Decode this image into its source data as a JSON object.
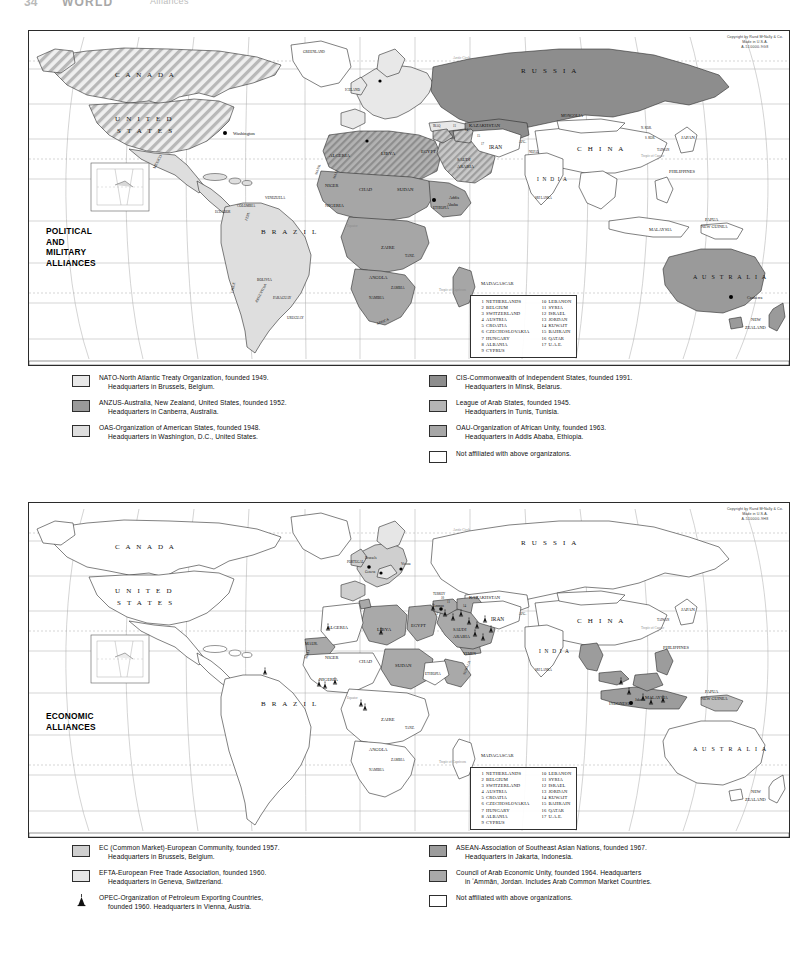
{
  "header": {
    "page_number": "34",
    "title": "WORLD",
    "subtitle": "Alliances"
  },
  "copyright": {
    "line1": "Copyright by Rand MᶜNally & Co.",
    "line2": "Made in U.S.A.",
    "line3_top": "A-510000-9G8",
    "line3_bottom": "A-510000-9H8",
    "suffix": "-2-3-3"
  },
  "maps": [
    {
      "id": "political-military",
      "caption": [
        "POLITICAL",
        "AND",
        "MILITARY",
        "ALLIANCES"
      ],
      "projection_note": "Robinson world projection, graticule at 20° intervals"
    },
    {
      "id": "economic",
      "caption": [
        "ECONOMIC",
        "ALLIANCES"
      ],
      "projection_note": "Robinson world projection, graticule at 20° intervals"
    }
  ],
  "index_box": {
    "left_column": [
      {
        "num": "1",
        "name": "NETHERLANDS"
      },
      {
        "num": "2",
        "name": "BELGIUM"
      },
      {
        "num": "3",
        "name": "SWITZERLAND"
      },
      {
        "num": "4",
        "name": "AUSTRIA"
      },
      {
        "num": "5",
        "name": "CROATIA"
      },
      {
        "num": "6",
        "name": "CZECHOSLOVAKIA"
      },
      {
        "num": "7",
        "name": "HUNGARY"
      },
      {
        "num": "8",
        "name": "ALBANIA"
      },
      {
        "num": "9",
        "name": "CYPRUS"
      }
    ],
    "right_column": [
      {
        "num": "10",
        "name": "LEBANON"
      },
      {
        "num": "11",
        "name": "SYRIA"
      },
      {
        "num": "12",
        "name": "ISRAEL"
      },
      {
        "num": "13",
        "name": "JORDAN"
      },
      {
        "num": "14",
        "name": "KUWAIT"
      },
      {
        "num": "15",
        "name": "BAHRAIN"
      },
      {
        "num": "16",
        "name": "QATAR"
      },
      {
        "num": "17",
        "name": "U.A.E."
      }
    ]
  },
  "legend_political": {
    "left": [
      {
        "key": "nato",
        "swatch": "#e8e8e8",
        "line1": "NATO-North Atlantic Treaty Organization, founded 1949.",
        "line2": "Headquarters in Brussels, Belgium."
      },
      {
        "key": "anzus",
        "swatch": "#9a9a9a",
        "line1": "ANZUS-Australia, New Zealand, United States, founded 1952.",
        "line2": "Headquarters in Canberra, Australia."
      },
      {
        "key": "oas",
        "swatch": "#dedede",
        "line1": "OAS-Organization of American States, founded 1948.",
        "line2": "Headquarters in Washington, D.C., United States."
      }
    ],
    "right": [
      {
        "key": "cis",
        "swatch": "#8d8d8d",
        "line1": "CIS-Commonwealth of Independent States, founded 1991.",
        "line2": "Headquarters in Minsk, Belarus."
      },
      {
        "key": "arab-league",
        "swatch": "#b5b5b5",
        "line1": "League of Arab States, founded 1945.",
        "line2": "Headquarters in Tunis, Tunisia."
      },
      {
        "key": "oau",
        "swatch": "#a6a6a6",
        "line1": "OAU-Organization of African Unity, founded 1963.",
        "line2": "Headquarters in Addis Ababa, Ethiopia."
      },
      {
        "key": "unaffiliated",
        "swatch": "#ffffff",
        "line1": "Not affiliated with above organizatons.",
        "line2": ""
      }
    ]
  },
  "legend_economic": {
    "left": [
      {
        "key": "ec",
        "swatch": "#cfcfcf",
        "line1": "EC (Common Market)-European Community, founded 1957.",
        "line2": "Headquarters in Brussels, Belgium."
      },
      {
        "key": "efta",
        "swatch": "#e6e6e6",
        "line1": "EFTA-European Free Trade Association, founded 1960.",
        "line2": "Headquarters in Geneva, Switzerland."
      },
      {
        "key": "opec",
        "swatch": "derrick",
        "line1": "OPEC-Organization of Petroleum Exporting Countries,",
        "line2": "founded 1960. Headquarters in Vienna, Austria."
      }
    ],
    "right": [
      {
        "key": "asean",
        "swatch": "#9c9c9c",
        "line1": "ASEAN-Association of Southeast Asian Nations, founded 1967.",
        "line2": "Headquarters in Jakarta, Indonesia."
      },
      {
        "key": "caeu",
        "swatch": "#a9a9a9",
        "line1": "Council of Arab Economic Unity, founded 1964. Headquarters",
        "line2": "in ʻAmmān, Jordan. Includes Arab Common Market Countries."
      },
      {
        "key": "unaffiliated",
        "swatch": "#ffffff",
        "line1": "Not affiliated with above organizations.",
        "line2": ""
      }
    ]
  },
  "map_labels": {
    "countries_major": [
      "CANADA",
      "UNITED STATES",
      "MEXICO",
      "BRAZIL",
      "RUSSIA",
      "CHINA",
      "INDIA",
      "AUSTRALIA",
      "NEW ZEALAND",
      "KAZAKHSTAN",
      "IRAN",
      "SAUDI ARABIA",
      "ALGERIA",
      "LIBYA",
      "EGYPT",
      "SUDAN",
      "CHAD",
      "NIGER",
      "NIGERIA",
      "ZAIRE",
      "ANGOLA",
      "MADAGASCAR",
      "JAPAN",
      "PHILIPPINES",
      "INDONESIA",
      "MALAYSIA",
      "PAPUA NEW GUINEA",
      "MONGOLIA",
      "ARGENTINA",
      "CHILE",
      "PERU",
      "BOLIVIA",
      "PARAGUAY",
      "URUGUAY",
      "COLOMBIA",
      "VENEZUELA",
      "ECUADOR",
      "GREENLAND",
      "MAUR.",
      "MALI",
      "ETHIOPIA",
      "SOMALIA",
      "SOUTH AFRICA",
      "TURKEY",
      "UKRAINE",
      "SPAIN",
      "FRANCE",
      "GERMANY",
      "POLAND",
      "ITALY",
      "TAIWAN",
      "THAI.",
      "VIETNAM",
      "NEPAL",
      "SRI LANKA",
      "YEMEN",
      "TANZ.",
      "ZAMBIA",
      "NAMIBIA",
      "BOTS.",
      "MOZ.",
      "C.A.R.",
      "CAM.",
      "AFG.",
      "PAKISTAN",
      "IRAQ",
      "N. KOR.",
      "S. KOR."
    ],
    "cities": [
      {
        "name": "Washington",
        "map": "political"
      },
      {
        "name": "Addis Ababa",
        "map": "political"
      },
      {
        "name": "Canberra",
        "map": "political"
      },
      {
        "name": "Minsk",
        "map": "political"
      },
      {
        "name": "Tunis",
        "map": "political"
      },
      {
        "name": "Brussels",
        "map": "economic"
      },
      {
        "name": "Geneva",
        "map": "economic"
      },
      {
        "name": "Vienna",
        "map": "economic"
      },
      {
        "name": "ʻAmmān",
        "map": "economic"
      },
      {
        "name": "Jakarta",
        "map": "economic"
      }
    ],
    "graticule": [
      "Arctic Circle",
      "Tropic of Cancer",
      "Equator",
      "Tropic of Capricorn"
    ],
    "meridians": [
      "160",
      "140",
      "120",
      "100",
      "80",
      "60",
      "40",
      "20",
      "0",
      "20",
      "40",
      "60",
      "80",
      "100",
      "120",
      "140",
      "160"
    ],
    "parallels": [
      "80",
      "60",
      "40",
      "20",
      "0",
      "20",
      "40",
      "60"
    ]
  },
  "colors": {
    "land_unaffiliated": "#ffffff",
    "nato_fill": "#e8e8e8",
    "anzus_fill": "#9a9a9a",
    "oas_fill": "#dedede",
    "cis_fill": "#8d8d8d",
    "arab_fill": "#b5b5b5",
    "oau_fill": "#a6a6a6",
    "ec_fill": "#cfcfcf",
    "efta_fill": "#e6e6e6",
    "asean_fill": "#9c9c9c",
    "caeu_fill": "#a9a9a9",
    "outline": "#2b2b2b",
    "graticule": "#9a9a9a",
    "page_bg": "#ffffff"
  }
}
